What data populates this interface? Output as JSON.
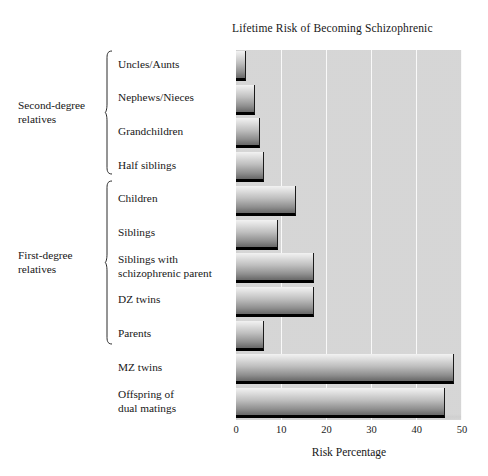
{
  "chart": {
    "title": "Lifetime Risk of Becoming Schizophrenic",
    "xlabel": "Risk Percentage"
  },
  "axis": {
    "ticks": [
      "0",
      "10",
      "20",
      "30",
      "40",
      "50"
    ]
  },
  "groups": [
    {
      "id": "second-degree",
      "label": "Second-degree\nrelatives",
      "line1": "Second-degree",
      "line2": "relatives"
    },
    {
      "id": "first-degree",
      "label": "First-degree\nrelatives",
      "line1": "First-degree",
      "line2": "relatives"
    }
  ],
  "categories": [
    "Uncles/Aunts",
    "Nephews/Nieces",
    "Grandchildren",
    "Half siblings",
    "Children",
    "Siblings",
    "Siblings with schizophrenic parent",
    "DZ twins",
    "Parents",
    "MZ twins",
    "Offspring of dual matings"
  ],
  "chart_data": {
    "type": "bar",
    "orientation": "horizontal",
    "title": "Lifetime Risk of Becoming Schizophrenic",
    "xlabel": "Risk Percentage",
    "ylabel": "",
    "xlim": [
      0,
      50
    ],
    "xticks": [
      0,
      10,
      20,
      30,
      40,
      50
    ],
    "grid": "vertical-white-gridlines",
    "legend": "none",
    "categories": [
      "Uncles/Aunts",
      "Nephews/Nieces",
      "Grandchildren",
      "Half siblings",
      "Children",
      "Siblings",
      "Siblings with schizophrenic parent",
      "DZ twins",
      "Parents",
      "MZ twins",
      "Offspring of dual matings"
    ],
    "values": [
      2,
      4,
      5,
      6,
      13,
      9,
      17,
      17,
      6,
      48,
      46
    ],
    "group_annotations": [
      {
        "label": "Second-degree relatives",
        "categories": [
          "Uncles/Aunts",
          "Nephews/Nieces",
          "Grandchildren",
          "Half siblings"
        ]
      },
      {
        "label": "First-degree relatives",
        "categories": [
          "Children",
          "Siblings",
          "Siblings with schizophrenic parent",
          "DZ twins",
          "Parents"
        ]
      }
    ]
  },
  "colors": {
    "panel": "#d2d2d2",
    "gridline": "#ffffff",
    "bar_top": "#f2f2f2",
    "bar_bottom": "#6a6a6a",
    "bar_edge": "#000000",
    "text": "#171717"
  }
}
